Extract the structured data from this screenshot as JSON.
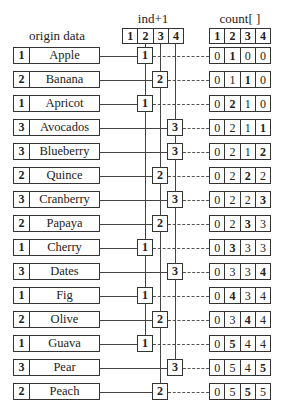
{
  "headers": {
    "origin": "origin data",
    "ind": "ind+1",
    "count": "count[ ]"
  },
  "ind_header_cells": [
    "1",
    "2",
    "3",
    "4"
  ],
  "count_header_cells": [
    "1",
    "2",
    "3",
    "4"
  ],
  "rows": [
    {
      "key": "1",
      "name": "Apple",
      "ind": "1",
      "count": [
        "0",
        "1",
        "0",
        "0"
      ],
      "bold": 1
    },
    {
      "key": "2",
      "name": "Banana",
      "ind": "2",
      "count": [
        "0",
        "1",
        "1",
        "0"
      ],
      "bold": 2
    },
    {
      "key": "1",
      "name": "Apricot",
      "ind": "1",
      "count": [
        "0",
        "2",
        "1",
        "0"
      ],
      "bold": 1
    },
    {
      "key": "3",
      "name": "Avocados",
      "ind": "3",
      "count": [
        "0",
        "2",
        "1",
        "1"
      ],
      "bold": 3
    },
    {
      "key": "3",
      "name": "Blueberry",
      "ind": "3",
      "count": [
        "0",
        "2",
        "1",
        "2"
      ],
      "bold": 3
    },
    {
      "key": "2",
      "name": "Quince",
      "ind": "2",
      "count": [
        "0",
        "2",
        "2",
        "2"
      ],
      "bold": 2
    },
    {
      "key": "3",
      "name": "Cranberry",
      "ind": "3",
      "count": [
        "0",
        "2",
        "2",
        "3"
      ],
      "bold": 3
    },
    {
      "key": "2",
      "name": "Papaya",
      "ind": "2",
      "count": [
        "0",
        "2",
        "3",
        "3"
      ],
      "bold": 2
    },
    {
      "key": "1",
      "name": "Cherry",
      "ind": "1",
      "count": [
        "0",
        "3",
        "3",
        "3"
      ],
      "bold": 1
    },
    {
      "key": "3",
      "name": "Dates",
      "ind": "3",
      "count": [
        "0",
        "3",
        "3",
        "4"
      ],
      "bold": 3
    },
    {
      "key": "1",
      "name": "Fig",
      "ind": "1",
      "count": [
        "0",
        "4",
        "3",
        "4"
      ],
      "bold": 1
    },
    {
      "key": "2",
      "name": "Olive",
      "ind": "2",
      "count": [
        "0",
        "3",
        "4",
        "4"
      ],
      "bold": 2
    },
    {
      "key": "1",
      "name": "Guava",
      "ind": "1",
      "count": [
        "0",
        "5",
        "4",
        "4"
      ],
      "bold": 1
    },
    {
      "key": "3",
      "name": "Pear",
      "ind": "3",
      "count": [
        "0",
        "5",
        "4",
        "5"
      ],
      "bold": 3
    },
    {
      "key": "2",
      "name": "Peach",
      "ind": "2",
      "count": [
        "0",
        "5",
        "5",
        "5"
      ],
      "bold": 2
    }
  ]
}
